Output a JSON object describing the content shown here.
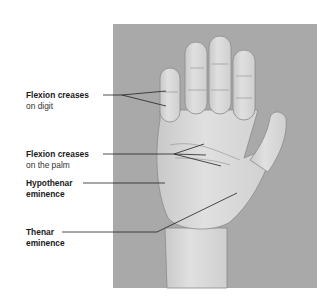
{
  "figure": {
    "background_color": "#a9a9a9",
    "skin_color": "#d9d9d9"
  },
  "labels": [
    {
      "id": "digit",
      "bold": "Flexion creases",
      "normal": "on digit"
    },
    {
      "id": "palm",
      "bold": "Flexion creases",
      "normal": "on the palm"
    },
    {
      "id": "hypothenar",
      "bold": "Hypothenar",
      "bold2": "eminence"
    },
    {
      "id": "thenar",
      "bold": "Thenar",
      "bold2": "eminence"
    }
  ]
}
